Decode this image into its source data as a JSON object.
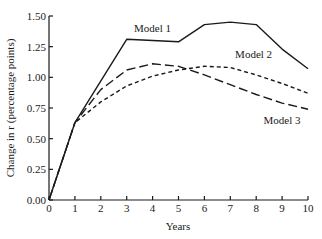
{
  "chart_data": {
    "type": "line",
    "title": "",
    "xlabel": "Years",
    "ylabel": "Change in r (percentage points)",
    "xlim": [
      0,
      10
    ],
    "ylim": [
      0,
      1.5
    ],
    "grid": false,
    "legend_position": "inline labels",
    "x_ticks": [
      "0",
      "1",
      "2",
      "3",
      "4",
      "5",
      "6",
      "7",
      "8",
      "9",
      "10"
    ],
    "y_ticks": [
      "0.00",
      "0.25",
      "0.50",
      "0.75",
      "1.00",
      "1.25",
      "1.50"
    ],
    "series": [
      {
        "name": "Model 1",
        "style": "solid",
        "x": [
          0,
          1,
          3,
          5,
          6,
          7,
          8,
          9,
          10
        ],
        "values": [
          0.0,
          0.63,
          1.31,
          1.29,
          1.43,
          1.45,
          1.43,
          1.23,
          1.07
        ]
      },
      {
        "name": "Model 2",
        "style": "short-dash",
        "x": [
          0,
          1,
          2,
          3,
          4,
          5,
          6,
          7,
          8,
          9,
          10
        ],
        "values": [
          0.0,
          0.63,
          0.8,
          0.93,
          1.01,
          1.06,
          1.09,
          1.08,
          1.02,
          0.95,
          0.87
        ]
      },
      {
        "name": "Model 3",
        "style": "long-dash",
        "x": [
          0,
          1,
          2,
          3,
          4,
          5,
          6,
          7,
          8,
          9,
          10
        ],
        "values": [
          0.0,
          0.63,
          0.9,
          1.06,
          1.11,
          1.09,
          1.02,
          0.94,
          0.86,
          0.79,
          0.74
        ]
      }
    ],
    "annotations": [
      {
        "text": "Model 1",
        "x": 4.0,
        "y": 1.37
      },
      {
        "text": "Model 2",
        "x": 7.9,
        "y": 1.16
      },
      {
        "text": "Model 3",
        "x": 9.0,
        "y": 0.62
      }
    ]
  },
  "colors": {
    "line": "#1a1a1a",
    "background": "#ffffff"
  }
}
